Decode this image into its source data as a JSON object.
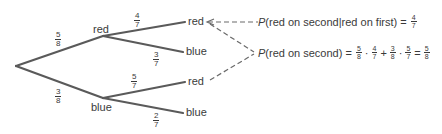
{
  "tree": {
    "root": {
      "x": 16,
      "y": 66
    },
    "first_level": [
      {
        "label": "red",
        "prob_num": "5",
        "prob_den": "8"
      },
      {
        "label": "blue",
        "prob_num": "3",
        "prob_den": "8"
      }
    ],
    "second_level": [
      {
        "parent": "red",
        "label": "red",
        "prob_num": "4",
        "prob_den": "7"
      },
      {
        "parent": "red",
        "label": "blue",
        "prob_num": "3",
        "prob_den": "7"
      },
      {
        "parent": "blue",
        "label": "red",
        "prob_num": "5",
        "prob_den": "7"
      },
      {
        "parent": "blue",
        "label": "blue",
        "prob_num": "2",
        "prob_den": "7"
      }
    ]
  },
  "annotations": {
    "conditional": {
      "p": "P",
      "text": "(red on second|red on first) = ",
      "num": "4",
      "den": "7"
    },
    "total": {
      "p": "P",
      "text": "(red on second) = ",
      "terms": [
        {
          "num": "5",
          "den": "8"
        },
        {
          "op": "·"
        },
        {
          "num": "4",
          "den": "7"
        },
        {
          "op": "+"
        },
        {
          "num": "3",
          "den": "8"
        },
        {
          "op": "·"
        },
        {
          "num": "5",
          "den": "7"
        },
        {
          "op": "="
        },
        {
          "num": "5",
          "den": "8"
        }
      ]
    }
  },
  "colors": {
    "line": "#5a5a5a",
    "text": "#3a3a3a",
    "dashed": "#6a6a6a"
  }
}
